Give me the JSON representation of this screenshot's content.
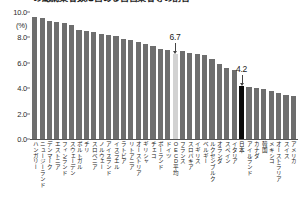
{
  "title": {
    "text": "の総就業者数に占める自営業者等の割合"
  },
  "axis": {
    "unit": "(%)",
    "yticks": [
      "10.0",
      "8.0",
      "6.0",
      "4.0",
      "2.0",
      "0.0"
    ]
  },
  "callouts": [
    {
      "label": "6.7",
      "series_index": 19
    },
    {
      "label": "4.2",
      "series_index": 28
    }
  ],
  "colors": {
    "bar": "#6e6e6e",
    "average_bar": "#d2d2d2",
    "highlight_bar": "#0a0a0a",
    "text": "#1a1a1a"
  },
  "chart_data": {
    "type": "bar",
    "title": "の総就業者数に占める自営業者等の割合",
    "xlabel": "",
    "ylabel": "(%)",
    "ylim": [
      0,
      10
    ],
    "yticks": [
      0,
      2,
      4,
      6,
      8,
      10
    ],
    "grid": false,
    "legend": "none",
    "annotations": [
      {
        "text": "6.7",
        "category": "OECD平均",
        "value": 6.7
      },
      {
        "text": "4.2",
        "category": "日本",
        "value": 4.2
      }
    ],
    "categories": [
      "ハンガリー",
      "ニュージーランド",
      "デンマーク",
      "エストニア",
      "フィンランド",
      "スウェーデン",
      "ポルトガル",
      "チリ",
      "スロベニア",
      "ノルウェー",
      "アイスランド",
      "イスラエル",
      "ラトビア",
      "リトアニア",
      "オーストリア",
      "ギリシャ",
      "チェコ",
      "ポーランド",
      "ドイツ",
      "OECD平均",
      "フランス",
      "スロバキア",
      "イギリス",
      "ベルギー",
      "ルクセンブルク",
      "オランダ",
      "スペイン",
      "イタリア",
      "日本",
      "アイルランド",
      "カナダ",
      "韓国",
      "メキシコ",
      "オーストラリア",
      "スイス",
      "アメリカ"
    ],
    "values": [
      9.6,
      9.5,
      9.3,
      9.2,
      9.1,
      9.0,
      8.6,
      8.5,
      8.4,
      8.3,
      8.2,
      8.1,
      7.9,
      7.8,
      7.6,
      7.5,
      7.3,
      7.1,
      7.0,
      6.7,
      6.9,
      6.8,
      6.7,
      6.6,
      6.3,
      5.9,
      5.6,
      5.4,
      4.2,
      4.1,
      4.0,
      3.9,
      3.8,
      3.6,
      3.5,
      3.4
    ]
  }
}
